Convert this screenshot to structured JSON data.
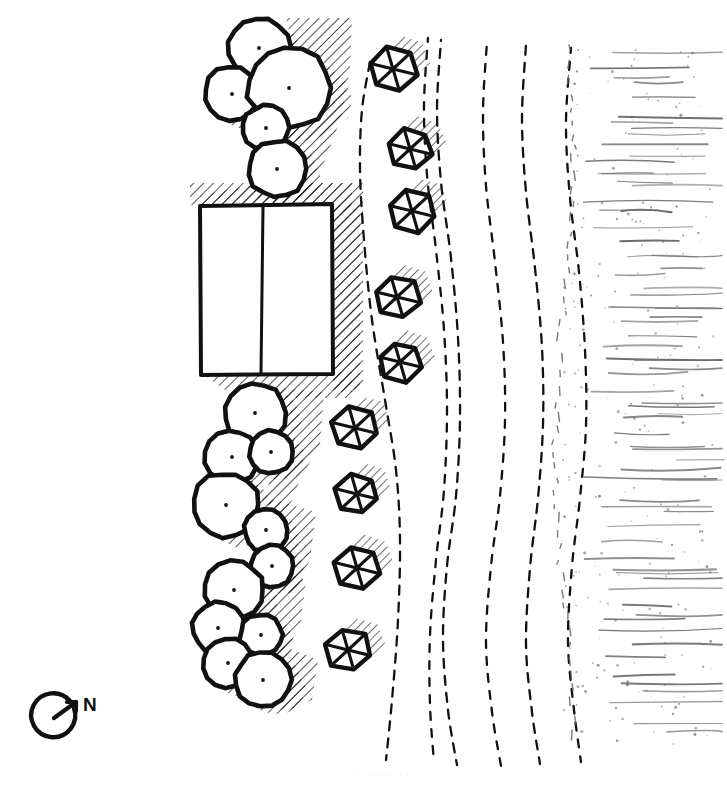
{
  "drawing": {
    "title": "Hand-drawn landscape site plan",
    "medium": "ink line drawing",
    "background_color": "#ffffff",
    "ink_color": "#111111",
    "texture_ink_color": "#6b6b6b",
    "canvas": {
      "width": 727,
      "height": 790
    }
  },
  "north_arrow": {
    "label": "N",
    "center": {
      "x": 55,
      "y": 716
    },
    "radius": 22,
    "arrow_direction": "up-right"
  },
  "caption": {
    "text": "· ·· ···· ·· ·· ·",
    "note": "faint cut-off caption at bottom edge"
  },
  "legend_semantics": {
    "tree_canopy": "broadleaf tree crown, plan view, circle with center dot",
    "hexagon_plant": "hexagonal spoked shrub / columnar tree symbol",
    "dashed_curve": "dashed contour or pathway line",
    "texture_field": "stippled and hatched ground / water texture band",
    "building": "two-bay rectangular structure"
  },
  "building": {
    "name": "two-bay structure",
    "x": 200,
    "y": 205,
    "width": 133,
    "height": 170,
    "bay_divider_x": 263,
    "bay_count": 2,
    "shadow_sides": [
      "top",
      "right"
    ],
    "outline_width": 4
  },
  "tree_clusters": [
    {
      "name": "north-cluster",
      "trees": [
        {
          "cx": 259,
          "cy": 48,
          "r": 31,
          "wobble": 1
        },
        {
          "cx": 232,
          "cy": 94,
          "r": 28,
          "wobble": 2
        },
        {
          "cx": 289,
          "cy": 88,
          "r": 41,
          "wobble": 3
        },
        {
          "cx": 266,
          "cy": 128,
          "r": 23,
          "wobble": 4
        },
        {
          "cx": 277,
          "cy": 169,
          "r": 29,
          "wobble": 5
        }
      ]
    },
    {
      "name": "mid-cluster",
      "trees": [
        {
          "cx": 255,
          "cy": 413,
          "r": 31,
          "wobble": 6
        },
        {
          "cx": 232,
          "cy": 457,
          "r": 27,
          "wobble": 7
        },
        {
          "cx": 271,
          "cy": 452,
          "r": 22,
          "wobble": 8
        },
        {
          "cx": 226,
          "cy": 505,
          "r": 33,
          "wobble": 9
        },
        {
          "cx": 266,
          "cy": 530,
          "r": 22,
          "wobble": 10
        },
        {
          "cx": 272,
          "cy": 566,
          "r": 22,
          "wobble": 11
        }
      ]
    },
    {
      "name": "south-cluster",
      "trees": [
        {
          "cx": 234,
          "cy": 590,
          "r": 30,
          "wobble": 12
        },
        {
          "cx": 218,
          "cy": 628,
          "r": 26,
          "wobble": 13
        },
        {
          "cx": 261,
          "cy": 635,
          "r": 21,
          "wobble": 14
        },
        {
          "cx": 228,
          "cy": 663,
          "r": 25,
          "wobble": 15
        },
        {
          "cx": 263,
          "cy": 680,
          "r": 28,
          "wobble": 16
        }
      ]
    }
  ],
  "hexagon_plants": [
    {
      "cx": 393,
      "cy": 69,
      "r": 24
    },
    {
      "cx": 410,
      "cy": 149,
      "r": 23
    },
    {
      "cx": 412,
      "cy": 211,
      "r": 24
    },
    {
      "cx": 397,
      "cy": 297,
      "r": 23
    },
    {
      "cx": 400,
      "cy": 362,
      "r": 22
    },
    {
      "cx": 355,
      "cy": 428,
      "r": 23
    },
    {
      "cx": 357,
      "cy": 494,
      "r": 22
    },
    {
      "cx": 357,
      "cy": 568,
      "r": 23
    },
    {
      "cx": 348,
      "cy": 650,
      "r": 23
    }
  ],
  "dashed_curves": [
    {
      "name": "path-1-west",
      "points": "370,62 362,110 360,170 364,240 372,320 385,400 396,470 400,540 398,620 392,700 386,760"
    },
    {
      "name": "path-2-inner",
      "points": "428,38 424,105 427,175 436,250 444,330 447,410 444,490 436,560 430,635 430,705 434,762"
    },
    {
      "name": "path-3-center",
      "points": "441,40 437,110 441,182 451,258 458,338 460,418 456,496 447,566 443,640 448,710 457,765"
    },
    {
      "name": "path-4-mid",
      "points": "487,42 483,112 486,186 495,262 503,342 505,420 500,496 491,566 486,642 492,712 501,766"
    },
    {
      "name": "path-5-east",
      "points": "526,45 522,118 526,192 535,268 542,348 543,424 538,498 530,568 526,644 532,712 540,764"
    },
    {
      "name": "path-6-far-east",
      "points": "571,48 566,122 570,198 579,272 585,350 586,426 580,498 572,566 568,642 574,710 581,762"
    }
  ],
  "texture_field": {
    "name": "ground texture band",
    "x": 560,
    "y": 45,
    "width": 162,
    "height": 700,
    "stroke_count": 46,
    "stipple_count": 230
  }
}
